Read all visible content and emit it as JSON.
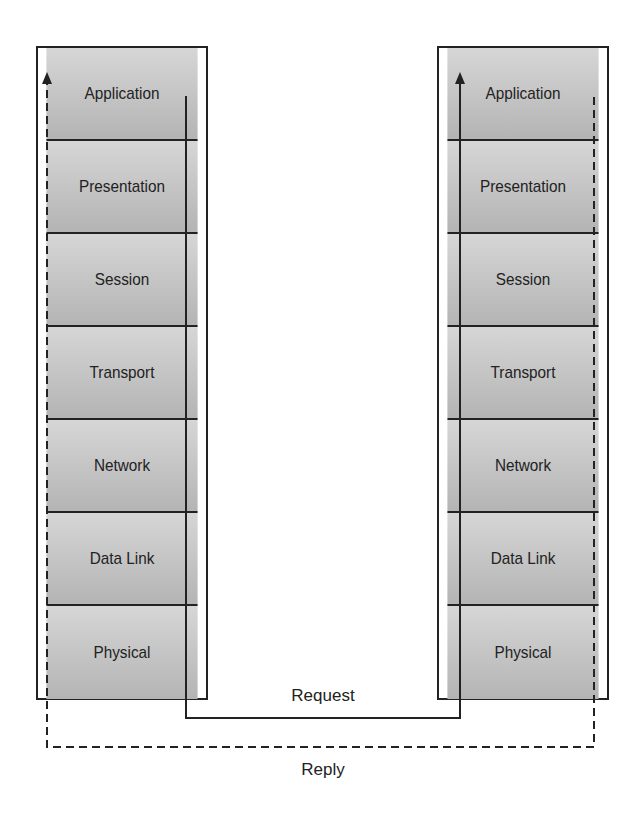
{
  "layers": [
    "Application",
    "Presentation",
    "Session",
    "Transport",
    "Network",
    "Data Link",
    "Physical"
  ],
  "left_stack": {
    "name": "sender"
  },
  "right_stack": {
    "name": "receiver"
  },
  "labels": {
    "request": "Request",
    "reply": "Reply"
  },
  "colors": {
    "line": "#222222",
    "layer_top": "#d6d6d6",
    "layer_bottom": "#b4b4b4"
  }
}
